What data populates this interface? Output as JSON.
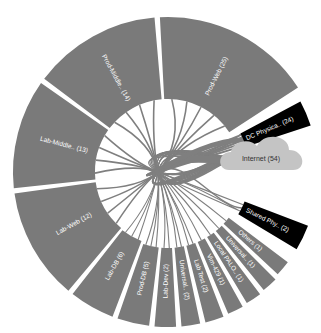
{
  "diagram": {
    "type": "chord-wheel",
    "center": {
      "x": 168,
      "y": 172
    },
    "inner_radius": 73,
    "outer_radius": 155,
    "colors": {
      "segment": "#7a7a7a",
      "highlight": "#000000",
      "chord": "#7f7f7f",
      "cloud": "#c4c4c4",
      "background": "#ffffff"
    },
    "segments": [
      {
        "id": "prod-web",
        "label": "Prod-Web (25)",
        "count": 25,
        "start": -3,
        "end": 57,
        "r0": 73,
        "r1": 155,
        "style": "segment"
      },
      {
        "id": "dc-physica",
        "label": "DC Physica.. (24)",
        "count": 24,
        "start": 62,
        "end": 72,
        "r0": 82,
        "r1": 150,
        "style": "highlight"
      },
      {
        "id": "shared-phy",
        "label": "Shared Phy.. (2)",
        "count": 2,
        "start": 111,
        "end": 121,
        "r0": 82,
        "r1": 150,
        "style": "highlight"
      },
      {
        "id": "others",
        "label": "Others (1)",
        "count": 1,
        "start": 127,
        "end": 133,
        "r0": 76,
        "r1": 150,
        "style": "segment"
      },
      {
        "id": "universal-1",
        "label": "Universal.. (1)",
        "count": 1,
        "start": 135,
        "end": 141,
        "r0": 76,
        "r1": 152,
        "style": "segment"
      },
      {
        "id": "local-palo",
        "label": "Local PALO.. (1)",
        "count": 1,
        "start": 143,
        "end": 149,
        "r0": 76,
        "r1": 153,
        "style": "segment"
      },
      {
        "id": "vim-429",
        "label": "Vim-429 (1)",
        "count": 1,
        "start": 151,
        "end": 157,
        "r0": 76,
        "r1": 154,
        "style": "segment"
      },
      {
        "id": "lab-test",
        "label": "Lab Test (2)",
        "count": 2,
        "start": 159,
        "end": 166,
        "r0": 76,
        "r1": 155,
        "style": "segment"
      },
      {
        "id": "universal-2",
        "label": "Universal.. (2)",
        "count": 2,
        "start": 168,
        "end": 175,
        "r0": 76,
        "r1": 155,
        "style": "segment"
      },
      {
        "id": "lab-dev",
        "label": "Lab-Dev (2)",
        "count": 2,
        "start": 177,
        "end": 185,
        "r0": 76,
        "r1": 155,
        "style": "segment"
      },
      {
        "id": "prod-db",
        "label": "Prod-DB (5)",
        "count": 5,
        "start": 187,
        "end": 199,
        "r0": 76,
        "r1": 155,
        "style": "segment"
      },
      {
        "id": "lab-db",
        "label": "Lab-DB (6)",
        "count": 6,
        "start": 201,
        "end": 218,
        "r0": 74,
        "r1": 155,
        "style": "segment"
      },
      {
        "id": "lab-web",
        "label": "Lab-Web (12)",
        "count": 12,
        "start": 220,
        "end": 262,
        "r0": 73,
        "r1": 155,
        "style": "segment"
      },
      {
        "id": "lab-middle",
        "label": "Lab-Middle.. (13)",
        "count": 13,
        "start": 264,
        "end": 305,
        "r0": 73,
        "r1": 155,
        "style": "segment"
      },
      {
        "id": "prod-middle",
        "label": "Prod-Middle.. (14)",
        "count": 14,
        "start": 307,
        "end": 355,
        "r0": 73,
        "r1": 155,
        "style": "segment"
      }
    ],
    "cloud": {
      "id": "internet",
      "label": "Internet (54)",
      "count": 54,
      "cx": 265,
      "cy": 158
    },
    "hub": {
      "x": 158,
      "y": 172
    }
  }
}
